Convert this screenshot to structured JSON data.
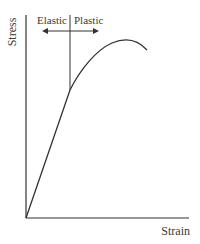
{
  "diagram": {
    "y_axis_label": "Stress",
    "x_axis_label": "Strain",
    "regions": [
      {
        "label": "Elastic"
      },
      {
        "label": "Plastic"
      }
    ],
    "colors": {
      "line": "#333333",
      "text": "#3a3a3a",
      "background": "#ffffff"
    }
  }
}
